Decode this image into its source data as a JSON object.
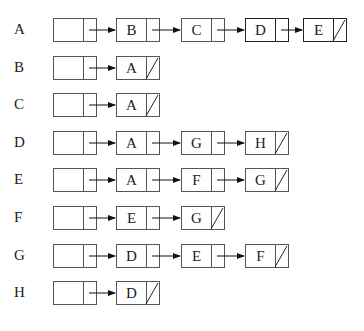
{
  "diagram": {
    "type": "adjacency-list",
    "rows": [
      {
        "vertex": "A",
        "adjacent": [
          "B",
          "C",
          "D",
          "E"
        ]
      },
      {
        "vertex": "B",
        "adjacent": [
          "A"
        ]
      },
      {
        "vertex": "C",
        "adjacent": [
          "A"
        ]
      },
      {
        "vertex": "D",
        "adjacent": [
          "A",
          "G",
          "H"
        ]
      },
      {
        "vertex": "E",
        "adjacent": [
          "A",
          "F",
          "G"
        ]
      },
      {
        "vertex": "F",
        "adjacent": [
          "E",
          "G"
        ]
      },
      {
        "vertex": "G",
        "adjacent": [
          "D",
          "E",
          "F"
        ]
      },
      {
        "vertex": "H",
        "adjacent": [
          "D"
        ]
      }
    ],
    "null_marker": "diagonal-slash",
    "colors": {
      "line": "#555555",
      "text": "#222222",
      "background": "#ffffff"
    }
  }
}
